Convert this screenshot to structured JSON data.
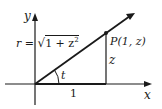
{
  "diagram": {
    "type": "right-triangle-on-axes",
    "axes": {
      "x_label": "x",
      "y_label": "y"
    },
    "point": {
      "label": "P(1, z)"
    },
    "hypotenuse_label": "r = √1 + z²",
    "hypotenuse": {
      "lhs": "r = ",
      "radicand": "1 + z",
      "exponent": "2"
    },
    "vertical_side_label": "z",
    "horizontal_side_label": "1",
    "angle_label": "t",
    "colors": {
      "ink": "#1a1a1a",
      "background": "#ffffff"
    }
  }
}
